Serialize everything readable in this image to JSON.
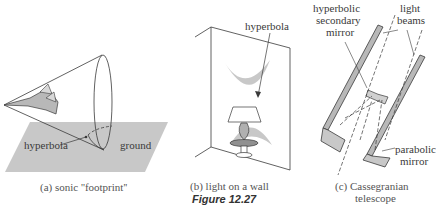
{
  "figure_title": "Figure 12.27",
  "colors": {
    "shade": "#c8c8c8",
    "line": "#3a3a3a",
    "background": "#ffffff"
  },
  "panels": [
    {
      "id": "a",
      "caption": "(a)  sonic ''footprint''",
      "labels": {
        "hyperbola": "hyperbola",
        "ground": "ground"
      }
    },
    {
      "id": "b",
      "caption": "(b)  light on a wall",
      "labels": {
        "hyperbola": "hyperbola"
      }
    },
    {
      "id": "c",
      "caption_line1": "(c)  Cassegranian",
      "caption_line2": "telescope",
      "labels": {
        "secondary_line1": "hyperbolic",
        "secondary_line2": "secondary",
        "secondary_line3": "mirror",
        "beams_line1": "light",
        "beams_line2": "beams",
        "primary_line1": "parabolic",
        "primary_line2": "mirror"
      }
    }
  ]
}
